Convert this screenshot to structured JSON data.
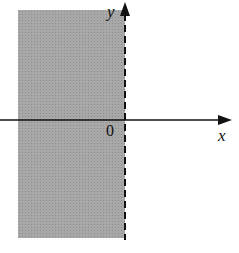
{
  "diagram": {
    "type": "half-plane region",
    "labels": {
      "x_axis": "x",
      "y_axis": "y",
      "origin": "0"
    },
    "region": {
      "inequality": "x < 0",
      "boundary": "x = 0 (dashed, not included)",
      "fill_color": "#a8a8a8"
    }
  }
}
